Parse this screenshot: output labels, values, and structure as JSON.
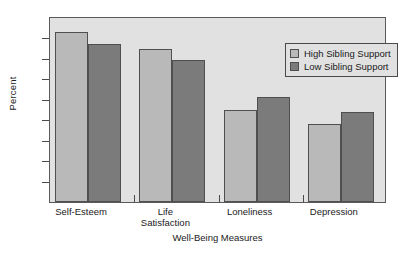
{
  "chart_data": {
    "type": "bar",
    "title": "",
    "xlabel": "Well-Being Measures",
    "ylabel": "Percent",
    "categories": [
      "Self-Esteem",
      "Life Satisfaction",
      "Loneliness",
      "Depression"
    ],
    "category_lines": [
      [
        "Self-Esteem"
      ],
      [
        "Life",
        "Satisfaction"
      ],
      [
        "Loneliness"
      ],
      [
        "Depression"
      ]
    ],
    "series": [
      {
        "name": "High Sibling Support",
        "color": "#b9b9b9",
        "values": [
          83,
          75,
          45,
          38
        ]
      },
      {
        "name": "Low Sibling Support",
        "color": "#7b7b7b",
        "values": [
          77.5,
          69.5,
          51.5,
          44
        ]
      }
    ],
    "ylim": [
      0,
      90
    ],
    "yticks": [
      0,
      10,
      20,
      30,
      40,
      50,
      60,
      70,
      80,
      90
    ],
    "ytick_labels": [
      "0",
      "10",
      "20",
      "30",
      "40",
      "50",
      "60",
      "70",
      "80",
      "90"
    ],
    "grid": false,
    "legend_position": "top-right",
    "plot_background": "#e1e1e1",
    "page_background": "#ffffff"
  },
  "legend": {
    "entries": [
      {
        "label": "High Sibling Support",
        "swatch": "high"
      },
      {
        "label": "Low Sibling Support",
        "swatch": "low"
      }
    ]
  }
}
